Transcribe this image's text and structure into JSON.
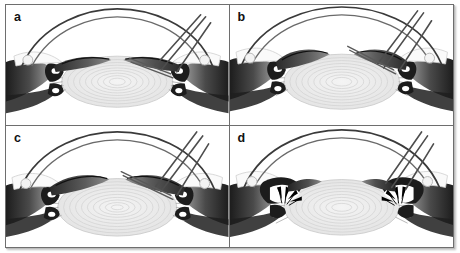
{
  "figure": {
    "panel_count": 4,
    "layout": "2x2 grid",
    "style": "grayscale line-and-tone medical illustration",
    "border_color": "#6e6e6e",
    "background_color": "#ffffff",
    "ink_color": "#2b2b2b"
  },
  "panels": [
    {
      "id": "a",
      "label": "a",
      "position": "top-left",
      "caption_text": "a",
      "structures": [
        "cornea",
        "anterior chamber",
        "iris",
        "ciliary body",
        "crystalline lens with concentric capsular rings",
        "zonular fibers",
        "sclera",
        "conjunctiva",
        "surgical instrument / needle entering through cornea"
      ],
      "instrument_present": true,
      "instrument_count": 2,
      "arrows_present": false
    },
    {
      "id": "b",
      "label": "b",
      "position": "top-right",
      "caption_text": "b",
      "structures": [
        "cornea",
        "anterior chamber",
        "iris retracted",
        "ciliary body",
        "crystalline lens with concentric capsular rings",
        "zonular fibers",
        "sclera",
        "surgical instrument / needle crossing anterior chamber"
      ],
      "instrument_present": true,
      "instrument_count": 2,
      "arrows_present": false
    },
    {
      "id": "c",
      "label": "c",
      "position": "bottom-left",
      "caption_text": "c",
      "structures": [
        "cornea",
        "anterior chamber",
        "iris",
        "ciliary body",
        "crystalline lens with concentric capsular rings",
        "zonular fibers",
        "sclera",
        "surgical instrument / needle entering through limbus"
      ],
      "instrument_present": true,
      "instrument_count": 2,
      "arrows_present": false
    },
    {
      "id": "d",
      "label": "d",
      "position": "bottom-right",
      "caption_text": "d",
      "structures": [
        "cornea",
        "anterior chamber",
        "iris",
        "ciliary body with contraction arrows",
        "crystalline lens with concentric capsular rings",
        "zonular fibers",
        "sclera",
        "surgical instrument / needle"
      ],
      "instrument_present": true,
      "instrument_count": 2,
      "arrows_present": true,
      "arrow_count": 8,
      "arrow_description": "solid black arrowheads radiating inward at the ciliary body on both sides"
    }
  ]
}
